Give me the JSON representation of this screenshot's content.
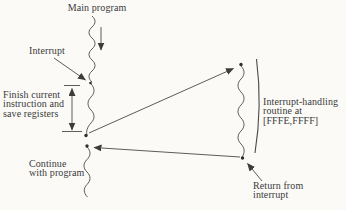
{
  "figure": {
    "type": "textbook-diagram",
    "background_color": "#fbfaf7",
    "ink_color": "#3c3c3c",
    "labels": {
      "main_program": "Main program",
      "interrupt": "Interrupt",
      "finish_instruction": "Finish current\ninstruction and\nsave registers",
      "continue_program": "Continue\nwith program",
      "interrupt_routine": "Interrupt-handling\nroutine at\n[FFFE,FFFF]",
      "return_from_interrupt": "Return from\ninterrupt"
    }
  }
}
